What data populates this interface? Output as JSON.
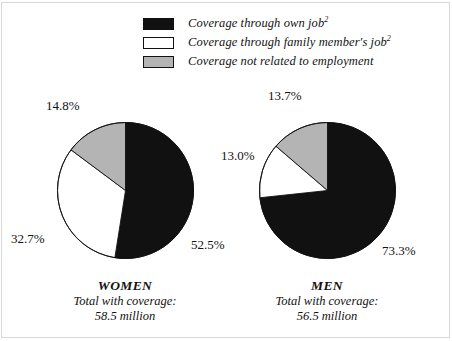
{
  "legend": {
    "items": [
      {
        "swatch": "black",
        "label": "Coverage through own job",
        "footnote": "2"
      },
      {
        "swatch": "white",
        "label": "Coverage through family member's job",
        "footnote": "2"
      },
      {
        "swatch": "gray",
        "label": "Coverage not related to employment",
        "footnote": ""
      }
    ]
  },
  "panels": {
    "women": {
      "title": "WOMEN",
      "total_label": "Total with coverage:",
      "total_value": "58.5 million",
      "labels": {
        "black": "52.5%",
        "white": "32.7%",
        "gray": "14.8%"
      }
    },
    "men": {
      "title": "MEN",
      "total_label": "Total with coverage:",
      "total_value": "56.5 million",
      "labels": {
        "black": "73.3%",
        "white": "13.0%",
        "gray": "13.7%"
      }
    }
  },
  "colors": {
    "black": "#111111",
    "white": "#ffffff",
    "gray": "#b4b4b4",
    "outline": "#111111",
    "frame": "#d8d8d8"
  },
  "chart_data": [
    {
      "type": "pie",
      "title": "WOMEN",
      "subtitle": "Total with coverage: 58.5 million",
      "categories": [
        "Coverage through own job",
        "Coverage through family member's job",
        "Coverage not related to employment"
      ],
      "values": [
        52.5,
        32.7,
        14.8
      ],
      "value_labels": [
        "52.5%",
        "32.7%",
        "14.8%"
      ],
      "slice_colors": [
        "#111111",
        "#ffffff",
        "#b4b4b4"
      ],
      "start_angle_deg": 0,
      "direction": "clockwise",
      "legend_position": "top"
    },
    {
      "type": "pie",
      "title": "MEN",
      "subtitle": "Total with coverage: 56.5 million",
      "categories": [
        "Coverage through own job",
        "Coverage through family member's job",
        "Coverage not related to employment"
      ],
      "values": [
        73.3,
        13.0,
        13.7
      ],
      "value_labels": [
        "73.3%",
        "13.0%",
        "13.7%"
      ],
      "slice_colors": [
        "#111111",
        "#ffffff",
        "#b4b4b4"
      ],
      "start_angle_deg": 0,
      "direction": "clockwise",
      "legend_position": "top"
    }
  ]
}
